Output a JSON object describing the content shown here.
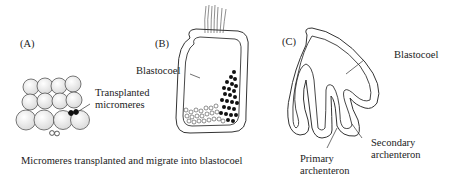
{
  "panels": {
    "a": {
      "label": "(A)",
      "annotation_line1": "Transplanted",
      "annotation_line2": "micromeres"
    },
    "b": {
      "label": "(B)",
      "annotation": "Blastocoel"
    },
    "c": {
      "label": "(C)",
      "blastocoel": "Blastocoel",
      "primary_line1": "Primary",
      "primary_line2": "archenteron",
      "secondary_line1": "Secondary",
      "secondary_line2": "archenteron"
    }
  },
  "caption": "Micromeres transplanted and migrate into blastocoel",
  "colors": {
    "stroke": "#333333",
    "cell_fill": "#ececec",
    "micromere_fill": "#111111"
  }
}
